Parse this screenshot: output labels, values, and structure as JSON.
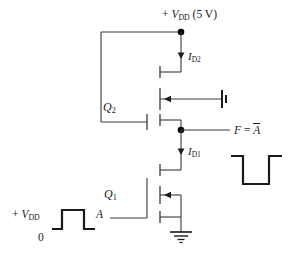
{
  "figure": {
    "kind": "circuit-diagram",
    "line_color": "#3a3a3a",
    "wave_color": "#1a1a1a",
    "node_color": "#000000",
    "text_color": "#1a1a1a",
    "background": "#ffffff"
  },
  "labels": {
    "supply_top": {
      "sign": "+",
      "symbol": "V",
      "subscript": "DD",
      "value": "(5 V)"
    },
    "current_load": {
      "symbol": "I",
      "subscript": "D2"
    },
    "current_driver": {
      "symbol": "I",
      "subscript": "D1"
    },
    "transistor_load": {
      "symbol": "Q",
      "subscript": "2"
    },
    "transistor_driver": {
      "symbol": "Q",
      "subscript": "1"
    },
    "output": {
      "prefix": "F",
      "equals": "=",
      "operand": "A",
      "overbar": true
    },
    "input_node": "A",
    "input_high": {
      "sign": "+",
      "symbol": "V",
      "subscript": "DD"
    },
    "input_low": "0"
  },
  "waveforms": {
    "input": {
      "name": "input-waveform-A",
      "shape": "positive-pulse",
      "high_label": "+V_DD",
      "low_label": "0"
    },
    "output": {
      "name": "output-waveform-F",
      "shape": "negative-pulse"
    }
  },
  "nodes": [
    {
      "name": "vdd-rail-node",
      "x": 181,
      "y": 32
    },
    {
      "name": "output-node",
      "x": 181,
      "y": 130
    }
  ]
}
